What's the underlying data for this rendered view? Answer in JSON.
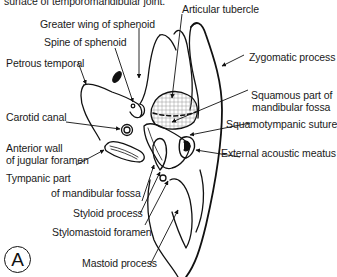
{
  "figure": {
    "panel_letter": "A",
    "caption_fragment": "surface of temporomandibular joint.",
    "labels": {
      "articular_tubercle": "Articular tubercle",
      "greater_wing_of_sphenoid": "Greater wing of sphenoid",
      "spine_of_sphenoid": "Spine of sphenoid",
      "petrous_temporal": "Petrous temporal",
      "zygomatic_process": "Zygomatic process",
      "squamous_part_line1": "Squamous part of",
      "squamous_part_line2": "mandibular fossa",
      "carotid_canal": "Carotid canal",
      "squamotympanic_suture": "Squamotympanic suture",
      "anterior_wall_line1": "Anterior wall",
      "anterior_wall_line2": "of jugular foramen",
      "external_acoustic_meatus": "External acoustic meatus",
      "tympanic_part_line1": "Tympanic part",
      "tympanic_part_line2": "of mandibular fossa",
      "styloid_process": "Styloid process",
      "stylomastoid_foramen": "Stylomastoid foramen",
      "mastoid_process": "Mastoid process"
    }
  }
}
